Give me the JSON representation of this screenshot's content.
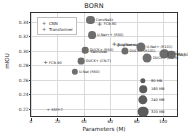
{
  "chart_data": {
    "type": "scatter",
    "title": "BORN",
    "xlabel": "Parameters (M)",
    "ylabel": "mIOU",
    "xlim": [
      0,
      112
    ],
    "ylim": [
      0.207,
      0.352
    ],
    "xticks": [
      0,
      20,
      40,
      60,
      80,
      100
    ],
    "yticks": [
      0.22,
      0.24,
      0.26,
      0.28,
      0.3,
      0.32,
      0.34
    ],
    "ytick_labels": [
      "0.22",
      "0.24",
      "0.26",
      "0.28",
      "0.30",
      "0.32",
      "0.34"
    ],
    "xtick_labels": [
      "0",
      "20",
      "40",
      "60",
      "80",
      "100"
    ],
    "grid": true,
    "legend_position": "upper-left",
    "size_encoding": "Model size (MB)",
    "series": [
      {
        "name": "CNN",
        "marker": "circle",
        "color": "#5a5a5a",
        "points": [
          {
            "label": "ConvNeXt",
            "x": 45,
            "y": 0.3425,
            "size_mb": 180
          },
          {
            "label": "U-Net++ (R50)",
            "x": 46,
            "y": 0.3215,
            "size_mb": 170
          },
          {
            "label": "DUCK+ (R50)",
            "x": 41,
            "y": 0.3005,
            "size_mb": 120
          },
          {
            "label": "DUCK+ (CN-T)",
            "x": 38,
            "y": 0.2855,
            "size_mb": 130
          },
          {
            "label": "U-Net (R50)",
            "x": 33,
            "y": 0.2705,
            "size_mb": 110
          },
          {
            "label": "DUCK+ (R101)",
            "x": 71,
            "y": 0.2995,
            "size_mb": 140
          },
          {
            "label": "U-Net+ (R101)",
            "x": 83,
            "y": 0.3055,
            "size_mb": 230
          },
          {
            "label": "DUCK+ (CN-S)",
            "x": 88,
            "y": 0.2895,
            "size_mb": 220
          },
          {
            "label": "U-Net++ (R101)",
            "x": 101,
            "y": 0.2955,
            "size_mb": 240
          },
          {
            "label": "DeepLabV3+",
            "x": 106,
            "y": 0.2945,
            "size_mb": 200
          }
        ]
      },
      {
        "name": "Transformer",
        "marker": "plus",
        "color": "#6e6e6e",
        "points": [
          {
            "label": "FCB-80",
            "x": 52,
            "y": 0.3365,
            "size_mb": 90
          },
          {
            "label": "U-Net+L",
            "x": 66,
            "y": 0.3085,
            "size_mb": 90
          },
          {
            "label": "SwinUNet",
            "x": 42,
            "y": 0.2985,
            "size_mb": 70
          },
          {
            "label": "FCB-90",
            "x": 11,
            "y": 0.2825,
            "size_mb": 60
          },
          {
            "label": "SSFP-T",
            "x": 13,
            "y": 0.2175,
            "size_mb": 40
          },
          {
            "label": "SegFormer",
            "x": 63,
            "y": 0.3075,
            "size_mb": 80
          }
        ]
      }
    ],
    "size_legend": {
      "title": "",
      "entries": [
        {
          "label": "80 MB",
          "size_mb": 80
        },
        {
          "label": "160 MB",
          "size_mb": 160
        },
        {
          "label": "240 MB",
          "size_mb": 240
        },
        {
          "label": "320 MB",
          "size_mb": 320
        }
      ]
    }
  },
  "legend": {
    "items": [
      {
        "label": "CNN",
        "marker": "+"
      },
      {
        "label": "Transformer",
        "marker": "+"
      }
    ]
  }
}
